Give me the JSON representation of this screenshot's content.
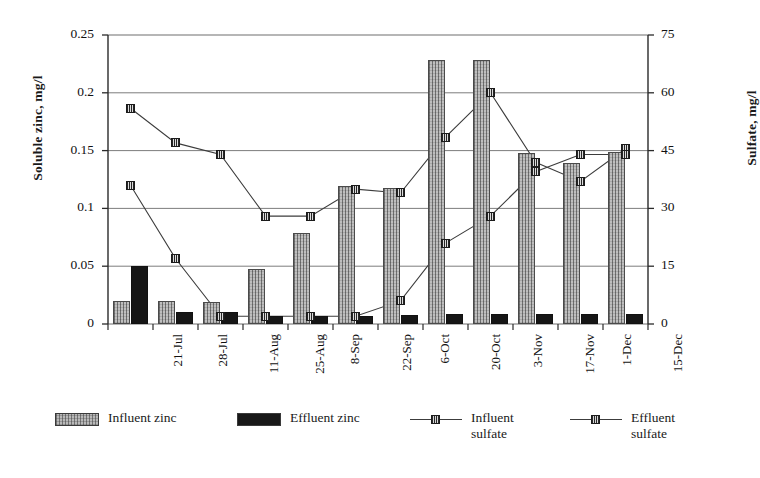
{
  "chart_data": {
    "type": "bar",
    "title": "",
    "xlabel": "",
    "categories": [
      "21-Jul",
      "28-Jul",
      "11-Aug",
      "25-Aug",
      "8-Sep",
      "22-Sep",
      "6-Oct",
      "20-Oct",
      "3-Nov",
      "17-Nov",
      "1-Dec",
      "15-Dec"
    ],
    "axes": {
      "left": {
        "label": "Soluble zinc, mg/l",
        "ticks": [
          "0",
          "0.05",
          "0.1",
          "0.15",
          "0.2",
          "0.25"
        ],
        "tick_values": [
          0,
          0.05,
          0.1,
          0.15,
          0.2,
          0.25
        ],
        "min": 0,
        "max": 0.25
      },
      "right": {
        "label": "Sulfate, mg/l",
        "ticks": [
          "0",
          "15",
          "30",
          "45",
          "60",
          "75"
        ],
        "tick_values": [
          0,
          15,
          30,
          45,
          60,
          75
        ],
        "min": 0,
        "max": 75
      }
    },
    "grid": true,
    "legend_position": "bottom",
    "series": [
      {
        "name": "Influent zinc",
        "type": "bar",
        "axis": "left",
        "color": "#b4b4b4",
        "values": [
          0.02,
          0.02,
          0.019,
          0.048,
          0.079,
          0.119,
          0.118,
          0.228,
          0.228,
          0.148,
          0.139,
          0.149
        ]
      },
      {
        "name": "Effluent zinc",
        "type": "bar",
        "axis": "left",
        "color": "#161616",
        "values": [
          0.05,
          0.01,
          0.01,
          0.007,
          0.007,
          0.007,
          0.008,
          0.009,
          0.009,
          0.009,
          0.009,
          0.009
        ]
      },
      {
        "name": "Influent\nsulfate",
        "type": "line",
        "axis": "right",
        "color": "#3c3c3c",
        "values": [
          56,
          47,
          44,
          28,
          28,
          35,
          34,
          48.5,
          60,
          42,
          37,
          45.5
        ]
      },
      {
        "name": "Effluent\nsulfate",
        "type": "line",
        "axis": "right",
        "color": "#3c3c3c",
        "values": [
          36,
          17,
          2,
          2,
          2,
          2,
          6,
          21,
          28,
          39.5,
          44,
          44
        ]
      }
    ]
  },
  "legend": {
    "items": [
      {
        "label": "Influent zinc",
        "marker": "bar-swatch-light"
      },
      {
        "label": "Effluent zinc",
        "marker": "bar-swatch-dark"
      },
      {
        "label": "Influent\nsulfate",
        "marker": "line-marker"
      },
      {
        "label": "Effluent\nsulfate",
        "marker": "line-marker"
      }
    ]
  }
}
